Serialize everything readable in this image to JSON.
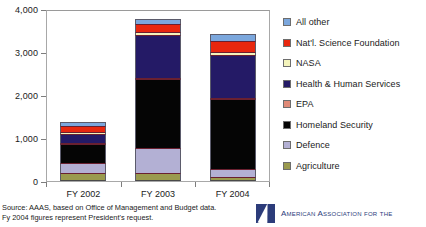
{
  "chart_data": {
    "type": "bar",
    "stacked": true,
    "title": "",
    "xlabel": "",
    "ylabel": "",
    "categories": [
      "FY 2002",
      "FY 2003",
      "FY 2004"
    ],
    "ylim": [
      0,
      4000
    ],
    "yticks": [
      0,
      1000,
      2000,
      3000,
      4000
    ],
    "ytick_labels": [
      "0",
      "1,000",
      "2,000",
      "3,000",
      "4,000"
    ],
    "grid": false,
    "legend_position": "right",
    "series": [
      {
        "name": "Agriculture",
        "color": "#9a9a4e",
        "values": [
          180,
          180,
          100
        ]
      },
      {
        "name": "Defence",
        "color": "#b3b0d4",
        "values": [
          250,
          580,
          180
        ]
      },
      {
        "name": "Homeland Security",
        "color": "#050505",
        "values": [
          430,
          1620,
          1630
        ]
      },
      {
        "name": "EPA",
        "color": "#e08a77",
        "values": [
          10,
          15,
          15
        ]
      },
      {
        "name": "Health & Human Services",
        "color": "#241a66",
        "values": [
          210,
          1000,
          1000
        ]
      },
      {
        "name": "NASA",
        "color": "#f4f4bc",
        "values": [
          50,
          70,
          70
        ]
      },
      {
        "name": "Nat'l. Science Foundation",
        "color": "#e8270f",
        "values": [
          130,
          180,
          250
        ]
      },
      {
        "name": "All other",
        "color": "#7ba7dd",
        "values": [
          110,
          110,
          160
        ]
      }
    ],
    "totals": [
      1360,
      3755,
      3405
    ]
  },
  "legend": {
    "items": [
      {
        "label": "All other",
        "color": "#7ba7dd"
      },
      {
        "label": "Nat'l. Science Foundation",
        "color": "#e8270f"
      },
      {
        "label": "NASA",
        "color": "#f4f4bc"
      },
      {
        "label": "Health & Human Services",
        "color": "#241a66"
      },
      {
        "label": "EPA",
        "color": "#e08a77"
      },
      {
        "label": "Homeland Security",
        "color": "#050505"
      },
      {
        "label": "Defence",
        "color": "#b3b0d4"
      },
      {
        "label": "Agriculture",
        "color": "#9a9a4e"
      }
    ]
  },
  "footer": {
    "source_line1": "Source: AAAS, based on Office of Management and Budget data.",
    "source_line2": "Fy 2004 figures represent President's request.",
    "logo_text": "American Association for the"
  }
}
